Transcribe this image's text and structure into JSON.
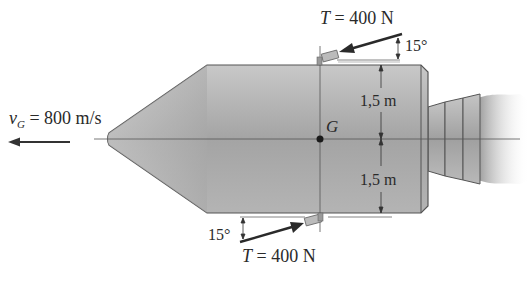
{
  "diagram": {
    "velocity_label": {
      "symbol": "v",
      "subscript": "G",
      "rest": " = 800 m/s"
    },
    "center_label": "G",
    "top_thrust": {
      "symbol": "T",
      "rest": " = 400 N",
      "angle": "15°"
    },
    "bottom_thrust": {
      "symbol": "T",
      "rest": " = 400 N",
      "angle": "15°"
    },
    "dim_upper": "1,5 m",
    "dim_lower": "1,5 m"
  },
  "colors": {
    "body_fill": "#a9a9a9",
    "body_stroke": "#555555",
    "line": "#444444",
    "arrow": "#2a2a2a",
    "thruster": "#b8b8b8"
  }
}
